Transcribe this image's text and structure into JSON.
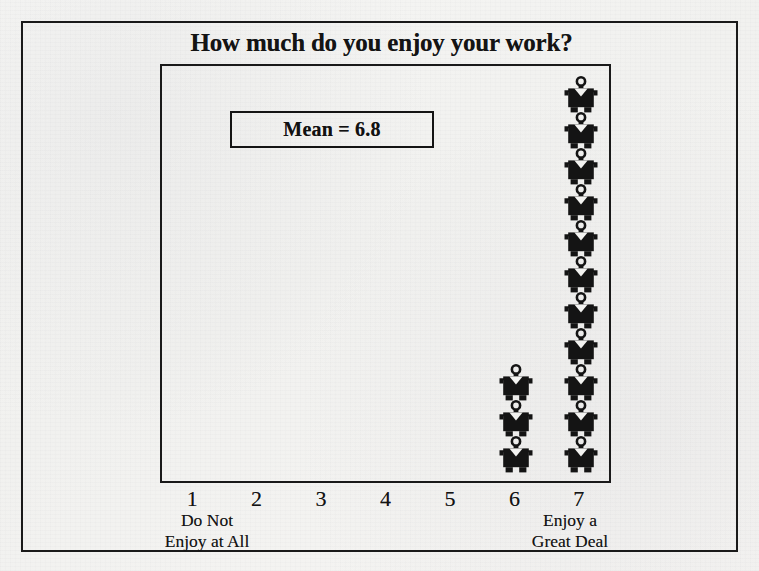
{
  "figure": {
    "title": "How much do you enjoy your work?",
    "mean_annotation": "Mean = 6.8",
    "ink_color": "#1a1a1a",
    "paper_color": "#f3f3f1"
  },
  "axis": {
    "tick_labels": [
      "1",
      "2",
      "3",
      "4",
      "5",
      "6",
      "7"
    ],
    "anchor_low": "Do Not\nEnjoy at All",
    "anchor_high": "Enjoy a\nGreat Deal"
  },
  "ghost_text": {
    "left": "",
    "right": "",
    "top": "",
    "bottom": ""
  },
  "chart_data": {
    "type": "bar",
    "render_style": "pictogram",
    "title": "How much do you enjoy your work?",
    "subtitle": "Mean = 6.8",
    "xlabel": "",
    "ylabel": "",
    "categories": [
      "1",
      "2",
      "3",
      "4",
      "5",
      "6",
      "7"
    ],
    "category_anchors": {
      "1": "Do Not Enjoy at All",
      "7": "Enjoy a Great Deal"
    },
    "values": [
      0,
      0,
      0,
      0,
      0,
      3,
      11
    ],
    "unit_symbol": "person-figure",
    "unit_value": 1,
    "mean": 6.8,
    "total_count": 14,
    "ylim": [
      0,
      11
    ],
    "grid": false,
    "legend": false,
    "series": [
      {
        "name": "Respondents",
        "values": [
          0,
          0,
          0,
          0,
          0,
          3,
          11
        ]
      }
    ],
    "annotations": [
      {
        "text": "Mean = 6.8",
        "boxed": true,
        "position": "upper-left-of-plot"
      }
    ]
  }
}
